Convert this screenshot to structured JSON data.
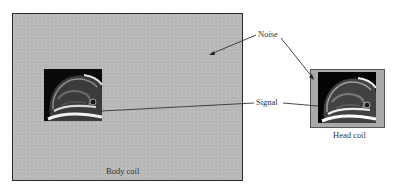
{
  "figure": {
    "panels": [
      {
        "id": "body-coil",
        "caption": "Body coil",
        "background": "#b9b9b9"
      },
      {
        "id": "head-coil",
        "caption": "Head coil",
        "background": "#a9a9a9"
      }
    ],
    "annotations": {
      "noise": "Noise",
      "signal": "Signal"
    },
    "colors": {
      "line": "#333333",
      "frame": "#2a2a2a",
      "image_bg": "#080808"
    }
  }
}
